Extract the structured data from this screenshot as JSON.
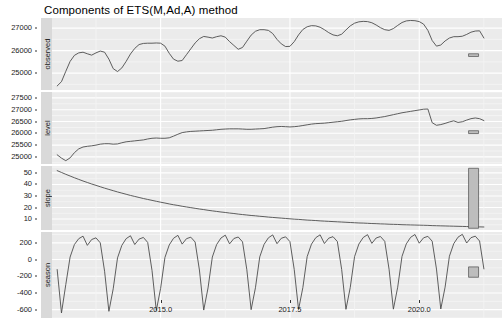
{
  "title": "Components of ETS(M,Ad,A) method",
  "axis": {
    "x_label": "",
    "x_ticks": [
      "2015.0",
      "2017.5",
      "2020.0"
    ],
    "x_tick_values": [
      2015.0,
      2017.5,
      2020.0
    ],
    "x_range": [
      2012.9,
      2021.6
    ]
  },
  "panels": [
    {
      "name": "observed",
      "strip_label": "observed",
      "y_ticks": [
        "25000",
        "26000",
        "27000"
      ],
      "y_tick_values": [
        25000,
        26000,
        27000
      ],
      "y_range": [
        24250,
        27450
      ],
      "scale_bar": {
        "center": 25800,
        "half_height": 60
      }
    },
    {
      "name": "level",
      "strip_label": "level",
      "y_ticks": [
        "25000",
        "25500",
        "26000",
        "26500",
        "27000",
        "27500"
      ],
      "y_tick_values": [
        25000,
        25500,
        26000,
        26500,
        27000,
        27500
      ],
      "y_range": [
        24700,
        27750
      ],
      "scale_bar": {
        "center": 26050,
        "half_height": 60
      }
    },
    {
      "name": "slope",
      "strip_label": "slope",
      "y_ticks": [
        "10",
        "20",
        "30",
        "40",
        "50"
      ],
      "y_tick_values": [
        10,
        20,
        30,
        40,
        50
      ],
      "y_range": [
        0.5,
        56
      ],
      "scale_bar": {
        "center": 28,
        "half_height": 26
      }
    },
    {
      "name": "season",
      "strip_label": "season",
      "y_ticks": [
        "-600",
        "-400",
        "-200",
        "0",
        "200"
      ],
      "y_tick_values": [
        -600,
        -400,
        -200,
        0,
        200
      ],
      "y_range": [
        -700,
        330
      ],
      "scale_bar": {
        "center": -150,
        "half_height": 62
      }
    }
  ],
  "colors": {
    "panel_background": "#ebebeb",
    "grid_major": "#ffffff",
    "grid_minor": "#f5f5f5",
    "strip_background": "#d9d9d9",
    "line": "#4d4d4d",
    "scale_bar_fill": "#bdbdbd",
    "scale_bar_border": "#4d4d4d",
    "text": "#1a1a1a",
    "page_background": "#ffffff"
  },
  "chart_data": {
    "type": "line",
    "title": "Components of ETS(M,Ad,A) method",
    "subtitle": "",
    "xlabel": "",
    "ylabel": "",
    "grid": true,
    "legend": "none",
    "faceted": true,
    "facet_order": [
      "observed",
      "level",
      "slope",
      "season"
    ],
    "xlim": [
      2012.9,
      2021.6
    ],
    "x_ticks": [
      2015.0,
      2017.5,
      2020.0
    ],
    "x": [
      2013.0,
      2013.0833,
      2013.1667,
      2013.25,
      2013.3333,
      2013.4167,
      2013.5,
      2013.5833,
      2013.6667,
      2013.75,
      2013.8333,
      2013.9167,
      2014.0,
      2014.0833,
      2014.1667,
      2014.25,
      2014.3333,
      2014.4167,
      2014.5,
      2014.5833,
      2014.6667,
      2014.75,
      2014.8333,
      2014.9167,
      2015.0,
      2015.0833,
      2015.1667,
      2015.25,
      2015.3333,
      2015.4167,
      2015.5,
      2015.5833,
      2015.6667,
      2015.75,
      2015.8333,
      2015.9167,
      2016.0,
      2016.0833,
      2016.1667,
      2016.25,
      2016.3333,
      2016.4167,
      2016.5,
      2016.5833,
      2016.6667,
      2016.75,
      2016.8333,
      2016.9167,
      2017.0,
      2017.0833,
      2017.1667,
      2017.25,
      2017.3333,
      2017.4167,
      2017.5,
      2017.5833,
      2017.6667,
      2017.75,
      2017.8333,
      2017.9167,
      2018.0,
      2018.0833,
      2018.1667,
      2018.25,
      2018.3333,
      2018.4167,
      2018.5,
      2018.5833,
      2018.6667,
      2018.75,
      2018.8333,
      2018.9167,
      2019.0,
      2019.0833,
      2019.1667,
      2019.25,
      2019.3333,
      2019.4167,
      2019.5,
      2019.5833,
      2019.6667,
      2019.75,
      2019.8333,
      2019.9167,
      2020.0,
      2020.0833,
      2020.1667,
      2020.25,
      2020.3333,
      2020.4167,
      2020.5,
      2020.5833,
      2020.6667,
      2020.75,
      2020.8333,
      2020.9167,
      2021.0,
      2021.0833,
      2021.1667,
      2021.25
    ],
    "series": [
      {
        "name": "observed",
        "panel": "observed",
        "ylim": [
          24250,
          27450
        ],
        "y_ticks": [
          25000,
          26000,
          27000
        ],
        "values": [
          24430,
          24620,
          25080,
          25520,
          25790,
          25900,
          25930,
          25860,
          25800,
          25900,
          25980,
          25930,
          25620,
          25200,
          25070,
          25230,
          25520,
          25850,
          26100,
          26270,
          26320,
          26330,
          26330,
          26340,
          26330,
          26200,
          25880,
          25620,
          25530,
          25560,
          25820,
          26080,
          26340,
          26530,
          26630,
          26600,
          26560,
          26620,
          26660,
          26600,
          26400,
          26230,
          26060,
          26140,
          26420,
          26690,
          26860,
          26930,
          26930,
          26900,
          26760,
          26500,
          26300,
          26180,
          26190,
          26400,
          26700,
          26940,
          27060,
          27110,
          27100,
          27040,
          26930,
          26800,
          26700,
          26660,
          26730,
          26920,
          27100,
          27220,
          27280,
          27300,
          27290,
          27240,
          27140,
          27020,
          26930,
          26900,
          26980,
          27120,
          27250,
          27320,
          27340,
          27330,
          27290,
          27180,
          26900,
          26450,
          26200,
          26250,
          26430,
          26560,
          26620,
          26620,
          26640,
          26720,
          26820,
          26870,
          26880,
          26560
        ]
      },
      {
        "name": "level",
        "panel": "level",
        "ylim": [
          24700,
          27750
        ],
        "y_ticks": [
          25000,
          25500,
          26000,
          26500,
          27000,
          27500
        ],
        "values": [
          25090,
          24950,
          24840,
          24960,
          25180,
          25340,
          25420,
          25450,
          25470,
          25500,
          25540,
          25560,
          25560,
          25540,
          25550,
          25600,
          25640,
          25660,
          25680,
          25700,
          25720,
          25760,
          25790,
          25800,
          25790,
          25790,
          25810,
          25880,
          25960,
          26030,
          26060,
          26080,
          26090,
          26100,
          26110,
          26120,
          26130,
          26150,
          26170,
          26180,
          26190,
          26190,
          26190,
          26180,
          26170,
          26170,
          26180,
          26190,
          26200,
          26230,
          26260,
          26280,
          26290,
          26280,
          26270,
          26280,
          26300,
          26330,
          26360,
          26390,
          26410,
          26420,
          26430,
          26450,
          26470,
          26490,
          26510,
          26540,
          26570,
          26590,
          26610,
          26620,
          26620,
          26630,
          26650,
          26680,
          26710,
          26750,
          26790,
          26830,
          26870,
          26900,
          26930,
          26960,
          26990,
          27020,
          27030,
          26450,
          26340,
          26370,
          26420,
          26480,
          26530,
          26460,
          26490,
          26560,
          26620,
          26650,
          26620,
          26540
        ]
      },
      {
        "name": "slope",
        "panel": "slope",
        "ylim": [
          0.5,
          56
        ],
        "y_ticks": [
          10,
          20,
          30,
          40,
          50
        ],
        "values": [
          52.0,
          50.4,
          48.8,
          47.3,
          45.8,
          44.4,
          43.0,
          41.7,
          40.4,
          39.2,
          38.0,
          36.8,
          35.7,
          34.6,
          33.5,
          32.5,
          31.5,
          30.5,
          29.6,
          28.7,
          27.8,
          27.0,
          26.2,
          25.4,
          24.6,
          23.9,
          23.1,
          22.4,
          21.8,
          21.1,
          20.5,
          19.9,
          19.3,
          18.7,
          18.2,
          17.6,
          17.1,
          16.6,
          16.1,
          15.7,
          15.2,
          14.8,
          14.3,
          13.9,
          13.5,
          13.1,
          12.8,
          12.4,
          12.1,
          11.7,
          11.4,
          11.1,
          10.8,
          10.5,
          10.2,
          9.9,
          9.7,
          9.4,
          9.1,
          8.9,
          8.7,
          8.4,
          8.2,
          8.0,
          7.8,
          7.6,
          7.4,
          7.2,
          7.0,
          6.8,
          6.6,
          6.5,
          6.3,
          6.1,
          6.0,
          5.8,
          5.7,
          5.5,
          5.4,
          5.3,
          5.1,
          5.0,
          4.9,
          4.8,
          4.7,
          4.6,
          4.5,
          4.3,
          4.2,
          4.1,
          4.0,
          3.9,
          3.8,
          3.7,
          3.6,
          3.5,
          3.4,
          3.3,
          3.2,
          3.1
        ]
      },
      {
        "name": "season",
        "panel": "season",
        "ylim": [
          -700,
          330
        ],
        "y_ticks": [
          -600,
          -400,
          -200,
          0,
          200
        ],
        "values": [
          -120,
          -640,
          -300,
          30,
          180,
          250,
          280,
          170,
          240,
          260,
          200,
          -140,
          -620,
          -350,
          20,
          170,
          250,
          285,
          180,
          245,
          265,
          205,
          -130,
          -610,
          -345,
          25,
          175,
          255,
          290,
          185,
          250,
          268,
          210,
          -125,
          -605,
          -340,
          30,
          180,
          258,
          292,
          188,
          252,
          270,
          212,
          -122,
          -600,
          -338,
          32,
          182,
          260,
          295,
          190,
          255,
          272,
          215,
          -120,
          -598,
          -335,
          35,
          185,
          262,
          296,
          192,
          256,
          274,
          216,
          -118,
          -596,
          -333,
          36,
          186,
          264,
          298,
          194,
          258,
          276,
          218,
          -116,
          -594,
          -331,
          38,
          188,
          266,
          300,
          196,
          260,
          278,
          220,
          -114,
          -592,
          -330,
          40,
          190,
          268,
          302,
          198,
          262,
          280,
          222,
          -112
        ]
      }
    ],
    "scale_bars": [
      {
        "panel": "observed",
        "x": 2021.05,
        "y_center": 25800,
        "y_half_range": 60
      },
      {
        "panel": "level",
        "x": 2021.05,
        "y_center": 26050,
        "y_half_range": 60
      },
      {
        "panel": "slope",
        "x": 2021.05,
        "y_center": 28,
        "y_half_range": 26
      },
      {
        "panel": "season",
        "x": 2021.05,
        "y_center": -150,
        "y_half_range": 62
      }
    ]
  }
}
